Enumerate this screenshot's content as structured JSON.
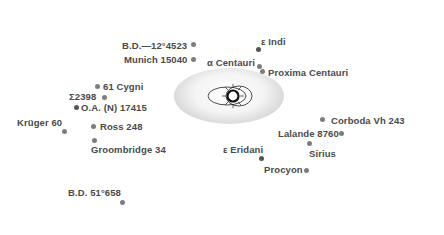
{
  "diagram": {
    "title": "",
    "center_object": "Sun",
    "rings": [
      {
        "id": "ring-1",
        "left": 174,
        "top": 68,
        "width": 110,
        "height": 56
      },
      {
        "id": "ring-2",
        "left": 121,
        "top": 44,
        "width": 212,
        "height": 122
      },
      {
        "id": "ring-3",
        "left": 70,
        "top": 27,
        "width": 312,
        "height": 170
      },
      {
        "id": "ring-4",
        "left": 14,
        "top": 10,
        "width": 420,
        "height": 219
      }
    ],
    "stars": [
      {
        "name": "B.D.—12°4523",
        "label": "B.D.—12°4523",
        "ring": 3
      },
      {
        "name": "Munich 15040",
        "label": "Munich 15040",
        "ring": 3
      },
      {
        "name": "α Centauri",
        "label": "α Centauri",
        "ring": 2
      },
      {
        "name": "Proxima Centauri",
        "label": "Proxima Centauri",
        "ring": 2
      },
      {
        "name": "ε Indi",
        "label": "ε Indi",
        "ring": 3
      },
      {
        "name": "61 Cygni",
        "label": "61 Cygni",
        "ring": 3
      },
      {
        "name": "Σ 2398",
        "label": "Σ 2398",
        "ring": 3
      },
      {
        "name": "O.A. (N) 17415",
        "label": "O.A. (N) 17415",
        "ring": 3
      },
      {
        "name": "Krüger 60",
        "label": "Krüger 60",
        "ring": 4
      },
      {
        "name": "Ross 248",
        "label": "Ross 248",
        "ring": 3
      },
      {
        "name": "Groombridge 34",
        "label": "Groombridge 34",
        "ring": 3
      },
      {
        "name": "ε Eridani",
        "label": "ε Eridani",
        "ring": 2
      },
      {
        "name": "Corboda Vh 243",
        "label": "Corboda Vh 243",
        "ring": 3
      },
      {
        "name": "Lalande 8760",
        "label": "Lalande 8760",
        "ring": 3
      },
      {
        "name": "Sirius",
        "label": "Sirius",
        "ring": 3
      },
      {
        "name": "Procyon",
        "label": "Procyon",
        "ring": 3
      },
      {
        "name": "B.D. 51°658",
        "label": "B.D. 51°658",
        "ring": 4
      }
    ]
  },
  "labels": {
    "bd_minus12": "B.D.—12°4523",
    "munich": "Munich 15040",
    "alpha_centauri": "α Centauri",
    "proxima": "Proxima Centauri",
    "eps_indi": "ε Indi",
    "cygni61": "61 Cygni",
    "sigma2398": "Σ2398",
    "oa17415": "O.A. (N) 17415",
    "kruger60": "Krüger 60",
    "ross248": "Ross 248",
    "groombridge34": "Groombridge 34",
    "eps_eridani": "ε Eridani",
    "corboda": "Corboda Vh 243",
    "lalande": "Lalande 8760",
    "sirius": "Sirius",
    "procyon": "Procyon",
    "bd51": "B.D. 51°658"
  },
  "colors": {
    "ring_shade": "#9a9a9a",
    "dot": "#7d7d7d",
    "dot_dark": "#555555",
    "label": "#4a4a4a",
    "background": "#ffffff"
  }
}
